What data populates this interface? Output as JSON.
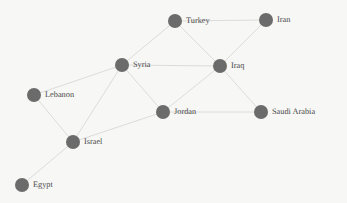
{
  "graph": {
    "title": "Middle East Country Network",
    "background_color": "#f7f7f5",
    "node_color": "#6b6b6b",
    "edge_color": "#dcdcda",
    "label_color": "#4a4a4a",
    "node_radius": 7,
    "nodes": [
      {
        "id": "turkey",
        "label": "Turkey",
        "x": 175,
        "y": 21,
        "label_dx": 11,
        "label_dy": 0
      },
      {
        "id": "iran",
        "label": "Iran",
        "x": 266,
        "y": 20,
        "label_dx": 11,
        "label_dy": 0
      },
      {
        "id": "syria",
        "label": "Syria",
        "x": 122,
        "y": 65,
        "label_dx": 11,
        "label_dy": 0
      },
      {
        "id": "iraq",
        "label": "Iraq",
        "x": 220,
        "y": 66,
        "label_dx": 11,
        "label_dy": 0
      },
      {
        "id": "lebanon",
        "label": "Lebanon",
        "x": 34,
        "y": 95,
        "label_dx": 11,
        "label_dy": 0
      },
      {
        "id": "jordan",
        "label": "Jordan",
        "x": 163,
        "y": 112,
        "label_dx": 11,
        "label_dy": 0
      },
      {
        "id": "saudi_arabia",
        "label": "Saudi Arabia",
        "x": 261,
        "y": 112,
        "label_dx": 11,
        "label_dy": 0
      },
      {
        "id": "israel",
        "label": "Israel",
        "x": 73,
        "y": 142,
        "label_dx": 11,
        "label_dy": 0
      },
      {
        "id": "egypt",
        "label": "Egypt",
        "x": 22,
        "y": 185,
        "label_dx": 11,
        "label_dy": 0
      }
    ],
    "edges": [
      {
        "id": "turkey-iran",
        "source": "turkey",
        "target": "iran"
      },
      {
        "id": "turkey-syria",
        "source": "turkey",
        "target": "syria"
      },
      {
        "id": "turkey-iraq",
        "source": "turkey",
        "target": "iraq"
      },
      {
        "id": "iran-iraq",
        "source": "iran",
        "target": "iraq"
      },
      {
        "id": "syria-iraq",
        "source": "syria",
        "target": "iraq"
      },
      {
        "id": "syria-lebanon",
        "source": "syria",
        "target": "lebanon"
      },
      {
        "id": "syria-jordan",
        "source": "syria",
        "target": "jordan"
      },
      {
        "id": "syria-israel",
        "source": "syria",
        "target": "israel"
      },
      {
        "id": "iraq-jordan",
        "source": "iraq",
        "target": "jordan"
      },
      {
        "id": "iraq-saudi_arabia",
        "source": "iraq",
        "target": "saudi_arabia"
      },
      {
        "id": "jordan-saudi_arabia",
        "source": "jordan",
        "target": "saudi_arabia"
      },
      {
        "id": "jordan-israel",
        "source": "jordan",
        "target": "israel"
      },
      {
        "id": "lebanon-israel",
        "source": "lebanon",
        "target": "israel"
      },
      {
        "id": "israel-egypt",
        "source": "israel",
        "target": "egypt"
      }
    ]
  }
}
